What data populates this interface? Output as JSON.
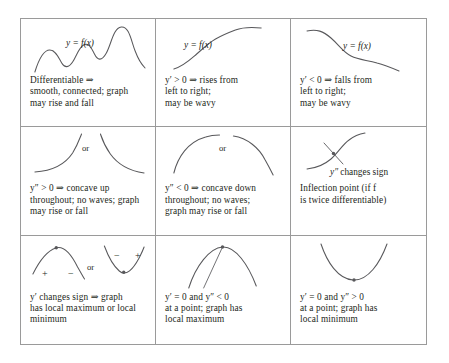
{
  "figure": {
    "title_sr": "Graphical behavior of a function from derivatives",
    "cells": [
      {
        "id": "differentiable",
        "curve_label": "y = f(x)",
        "sketch_name": "wavy-increasing-curve",
        "caption_lines": [
          "Differentiable ⇒",
          "smooth, connected; graph",
          "may rise and fall"
        ]
      },
      {
        "id": "first-derivative-positive",
        "curve_label": "y = f(x)",
        "sketch_name": "rising-wavy-curve",
        "caption_lines": [
          "y′ > 0 ⇒ rises from",
          "left to right;",
          "may be wavy"
        ]
      },
      {
        "id": "first-derivative-negative",
        "curve_label": "y = f(x)",
        "sketch_name": "falling-wavy-curve",
        "caption_lines": [
          "y′ < 0 ⇒ falls from",
          "left to right;",
          "may be wavy"
        ]
      },
      {
        "id": "second-derivative-positive",
        "or_label": "or",
        "sketch_name": "concave-up-pair-curve",
        "caption_lines": [
          "y″ > 0 ⇒ concave up",
          "throughout; no waves; graph",
          "may rise or fall"
        ]
      },
      {
        "id": "second-derivative-negative",
        "or_label": "or",
        "sketch_name": "concave-down-pair-curve",
        "caption_lines": [
          "y″ < 0 ⇒ concave down",
          "throughout; no waves;",
          "graph may rise or fall"
        ]
      },
      {
        "id": "inflection-point",
        "inline_label": "y″ changes sign",
        "sketch_name": "inflection-point-curve",
        "caption_lines": [
          "Inflection point (if f",
          "is twice differentiable)"
        ]
      },
      {
        "id": "first-derivative-sign-change",
        "or_label": "or",
        "sketch_name": "sign-change-extremum-curves",
        "signs": [
          "+",
          "−",
          "−",
          "+"
        ],
        "caption_lines": [
          "y′ changes sign ⇒ graph",
          "has local maximum or local",
          "minimum"
        ]
      },
      {
        "id": "local-maximum",
        "sketch_name": "local-maximum-curve",
        "caption_lines": [
          "y′ = 0  and  y″ < 0",
          "at a point; graph has",
          "local maximum"
        ]
      },
      {
        "id": "local-minimum",
        "sketch_name": "local-minimum-curve",
        "caption_lines": [
          "y′ = 0  and  y″ > 0",
          "at a point; graph has",
          "local minimum"
        ]
      }
    ],
    "colors": {
      "border": "#9a9a9a",
      "curve": "#58585b",
      "text": "#231f20",
      "background": "#ffffff"
    }
  }
}
